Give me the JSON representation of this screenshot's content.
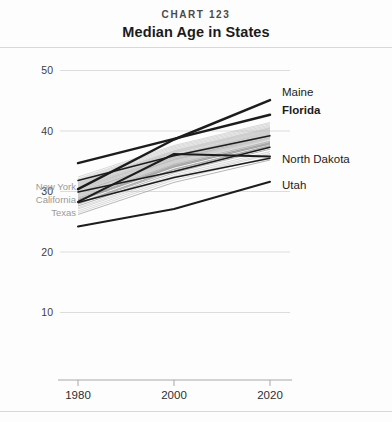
{
  "header": {
    "kicker": "CHART 123",
    "title": "Median Age in States"
  },
  "chart_data": {
    "type": "line",
    "title": "Median Age in States",
    "subtitle": "CHART 123",
    "xlabel": "",
    "ylabel": "",
    "x": [
      1980,
      2000,
      2020
    ],
    "xticklabels": [
      "1980",
      "2000",
      "2020"
    ],
    "xlim": [
      1980,
      2020
    ],
    "yticks": [
      10,
      20,
      30,
      40,
      50
    ],
    "yticklabels": [
      "10",
      "20",
      "30",
      "40",
      "50"
    ],
    "ylim": [
      5,
      52
    ],
    "grid": true,
    "legend_position": "inline-end-labels",
    "highlight_color": "#1c1c1c",
    "background_line_color": "#b9b9b9",
    "left_label_color": "#9a9a9a",
    "highlighted_series": [
      {
        "name": "Maine",
        "label_side": "right",
        "bold": false,
        "values": [
          30.4,
          38.6,
          45.1
        ]
      },
      {
        "name": "Florida",
        "label_side": "right",
        "bold": true,
        "values": [
          34.7,
          38.7,
          42.7
        ]
      },
      {
        "name": "North Dakota",
        "label_side": "right",
        "bold": false,
        "values": [
          28.3,
          36.2,
          35.8
        ]
      },
      {
        "name": "Utah",
        "label_side": "right",
        "bold": false,
        "values": [
          24.2,
          27.1,
          31.6
        ]
      },
      {
        "name": "New York",
        "label_side": "left",
        "bold": false,
        "values": [
          31.8,
          35.9,
          39.2
        ]
      },
      {
        "name": "California",
        "label_side": "left",
        "bold": false,
        "values": [
          29.9,
          33.3,
          37.3
        ]
      },
      {
        "name": "Texas",
        "label_side": "left",
        "bold": false,
        "values": [
          28.2,
          32.3,
          35.5
        ]
      }
    ],
    "background_series_note": "All remaining US states shown as light gray lines",
    "background_series": [
      {
        "values": [
          29.8,
          35.3,
          39.2
        ]
      },
      {
        "values": [
          30.3,
          35.9,
          39.6
        ]
      },
      {
        "values": [
          29.2,
          34.7,
          38.6
        ]
      },
      {
        "values": [
          31.0,
          36.3,
          40.1
        ]
      },
      {
        "values": [
          28.6,
          34.2,
          38.1
        ]
      },
      {
        "values": [
          30.8,
          36.0,
          39.9
        ]
      },
      {
        "values": [
          29.5,
          35.0,
          38.9
        ]
      },
      {
        "values": [
          31.4,
          36.6,
          40.4
        ]
      },
      {
        "values": [
          28.9,
          34.5,
          38.3
        ]
      },
      {
        "values": [
          30.1,
          35.6,
          39.4
        ]
      },
      {
        "values": [
          29.0,
          34.4,
          38.2
        ]
      },
      {
        "values": [
          31.7,
          37.0,
          40.8
        ]
      },
      {
        "values": [
          28.4,
          34.0,
          37.9
        ]
      },
      {
        "values": [
          30.6,
          35.8,
          39.7
        ]
      },
      {
        "values": [
          29.6,
          35.1,
          39.0
        ]
      },
      {
        "values": [
          31.2,
          36.4,
          40.2
        ]
      },
      {
        "values": [
          28.1,
          33.7,
          37.6
        ]
      },
      {
        "values": [
          30.0,
          35.4,
          39.3
        ]
      },
      {
        "values": [
          29.3,
          34.8,
          38.7
        ]
      },
      {
        "values": [
          31.9,
          37.2,
          41.0
        ]
      },
      {
        "values": [
          27.9,
          33.4,
          37.3
        ]
      },
      {
        "values": [
          30.5,
          35.7,
          39.5
        ]
      },
      {
        "values": [
          29.9,
          35.2,
          39.1
        ]
      },
      {
        "values": [
          31.5,
          36.8,
          40.6
        ]
      },
      {
        "values": [
          28.7,
          34.3,
          38.0
        ]
      },
      {
        "values": [
          30.2,
          35.5,
          39.4
        ]
      },
      {
        "values": [
          29.4,
          34.9,
          38.8
        ]
      },
      {
        "values": [
          32.1,
          37.4,
          41.2
        ]
      },
      {
        "values": [
          27.6,
          33.1,
          37.0
        ]
      },
      {
        "values": [
          30.7,
          35.9,
          39.8
        ]
      },
      {
        "values": [
          29.1,
          34.6,
          38.4
        ]
      },
      {
        "values": [
          31.1,
          36.5,
          40.3
        ]
      },
      {
        "values": [
          28.0,
          33.6,
          37.5
        ]
      },
      {
        "values": [
          30.9,
          36.1,
          40.0
        ]
      },
      {
        "values": [
          29.7,
          35.2,
          38.9
        ]
      },
      {
        "values": [
          31.3,
          36.7,
          40.5
        ]
      },
      {
        "values": [
          28.5,
          34.1,
          37.8
        ]
      },
      {
        "values": [
          30.4,
          35.6,
          39.3
        ]
      },
      {
        "values": [
          26.8,
          32.2,
          36.1
        ]
      },
      {
        "values": [
          27.3,
          32.8,
          36.6
        ]
      },
      {
        "values": [
          26.2,
          31.5,
          35.2
        ]
      },
      {
        "values": [
          32.4,
          37.6,
          41.4
        ]
      },
      {
        "values": [
          27.1,
          32.5,
          36.3
        ]
      },
      {
        "values": [
          26.5,
          31.9,
          35.7
        ]
      }
    ]
  },
  "labels": {
    "right": [
      "Maine",
      "Florida",
      "North Dakota",
      "Utah"
    ],
    "left": [
      "New York",
      "California",
      "Texas"
    ]
  }
}
